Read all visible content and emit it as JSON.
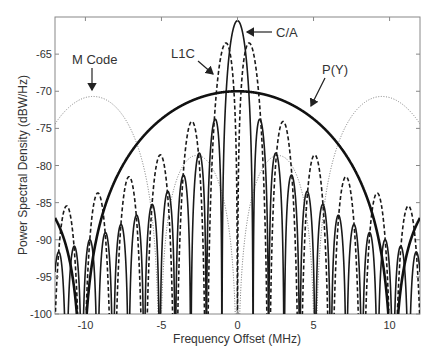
{
  "chart_data": {
    "type": "line",
    "title": "",
    "xlabel": "Frequency Offset (MHz)",
    "ylabel": "Power Spectral Density (dBW/Hz)",
    "xlim": [
      -12,
      12
    ],
    "ylim": [
      -100,
      -60
    ],
    "xticks": [
      -10,
      -5,
      0,
      5,
      10
    ],
    "yticks": [
      -65,
      -70,
      -75,
      -80,
      -85,
      -90,
      -95,
      -100
    ],
    "grid": false,
    "legend": "none (inline annotations with arrows)",
    "series": [
      {
        "name": "C/A",
        "style": "solid-thin",
        "signal": "BPSK(1)",
        "peak_db": -60.5,
        "peak_at_mhz": [
          0
        ],
        "null_spacing_mhz": 1.023
      },
      {
        "name": "L1C",
        "style": "dashed",
        "signal": "BOC(1,1)",
        "peak_db": -63.5,
        "peak_at_mhz": [
          -1,
          1
        ]
      },
      {
        "name": "P(Y)",
        "style": "solid-thick",
        "signal": "BPSK(10)",
        "peak_db": -70,
        "peak_at_mhz": [
          0
        ],
        "first_null_mhz": 10.23
      },
      {
        "name": "M Code",
        "style": "dotted",
        "signal": "BOC(10,5)",
        "peak_db": -70.7,
        "peak_at_mhz": [
          -9.5,
          9.5
        ]
      }
    ],
    "annotations": [
      {
        "text": "C/A",
        "arrow_to": [
          0.5,
          -62
        ]
      },
      {
        "text": "L1C",
        "arrow_to": [
          -1.3,
          -66
        ]
      },
      {
        "text": "P(Y)",
        "arrow_to": [
          5.5,
          -72.5
        ]
      },
      {
        "text": "M Code",
        "arrow_to": [
          -9.5,
          -70.8
        ]
      }
    ]
  },
  "labels": {
    "xlabel": "Frequency Offset (MHz)",
    "ylabel": "Power Spectral Density (dBW/Hz)",
    "ann_ca": "C/A",
    "ann_l1c": "L1C",
    "ann_py": "P(Y)",
    "ann_m": "M Code"
  }
}
